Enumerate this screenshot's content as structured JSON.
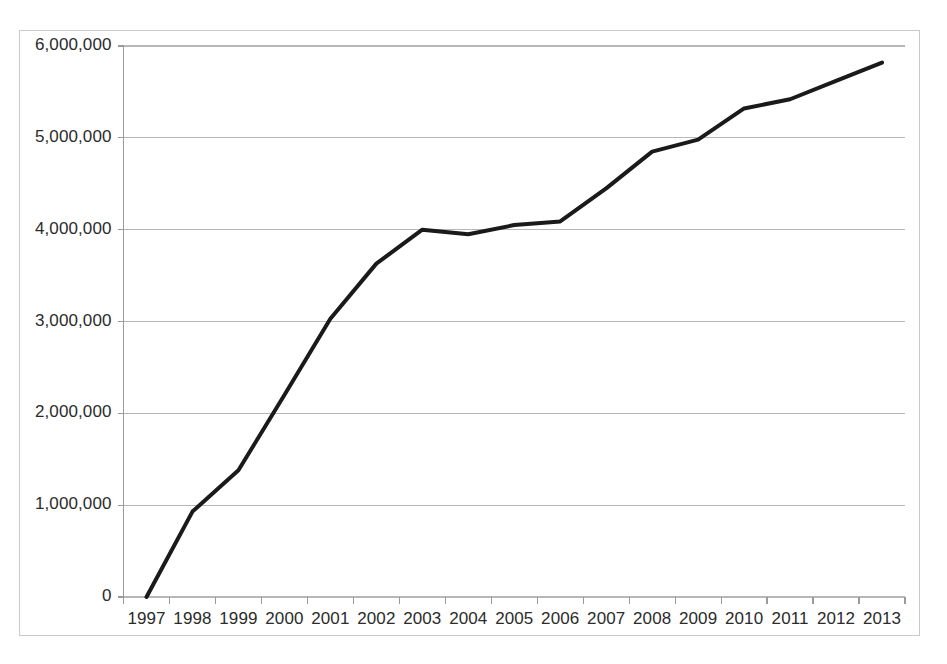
{
  "chart_data": {
    "type": "line",
    "title": "",
    "subtitle": "",
    "xlabel": "",
    "ylabel": "",
    "categories": [
      "1997",
      "1998",
      "1999",
      "2000",
      "2001",
      "2002",
      "2003",
      "2004",
      "2005",
      "2006",
      "2007",
      "2008",
      "2009",
      "2010",
      "2011",
      "2012",
      "2013"
    ],
    "x": [
      1997,
      1998,
      1999,
      2000,
      2001,
      2002,
      2003,
      2004,
      2005,
      2006,
      2007,
      2008,
      2009,
      2010,
      2011,
      2012,
      2013
    ],
    "values": [
      0,
      930000,
      1380000,
      2200000,
      3030000,
      3630000,
      4000000,
      3950000,
      4050000,
      4090000,
      4450000,
      4850000,
      4980000,
      5320000,
      5420000,
      5620000,
      5820000
    ],
    "series": [
      {
        "name": "",
        "values": [
          0,
          930000,
          1380000,
          2200000,
          3030000,
          3630000,
          4000000,
          3950000,
          4050000,
          4090000,
          4450000,
          4850000,
          4980000,
          5320000,
          5420000,
          5620000,
          5820000
        ],
        "color": "#1a1a1a"
      }
    ],
    "ylim": [
      0,
      6000000
    ],
    "ytick_values": [
      0,
      1000000,
      2000000,
      3000000,
      4000000,
      5000000,
      6000000
    ],
    "ytick_labels": [
      "0",
      "1,000,000",
      "2,000,000",
      "3,000,000",
      "4,000,000",
      "5,000,000",
      "6,000,000"
    ],
    "xtick_labels": [
      "1997",
      "1998",
      "1999",
      "2000",
      "2001",
      "2002",
      "2003",
      "2004",
      "2005",
      "2006",
      "2007",
      "2008",
      "2009",
      "2010",
      "2011",
      "2012",
      "2013"
    ],
    "grid": true,
    "grid_axis": "y",
    "grid_color": "#b7b7b7",
    "legend": false,
    "legend_position": "none",
    "line_color": "#1a1a1a",
    "line_width": 4,
    "markers": false,
    "plot_border_color": "#c9c9c9",
    "axis_color": "#9a9a9a",
    "background_color": "#ffffff"
  }
}
